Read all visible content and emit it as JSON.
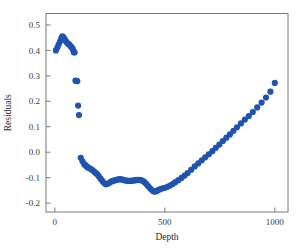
{
  "chart_data": {
    "type": "scatter",
    "title": "",
    "xlabel": "Depth",
    "ylabel": "Residuals",
    "xlim": [
      -40,
      1060
    ],
    "ylim": [
      -0.235,
      0.545
    ],
    "xticks": [
      0,
      500,
      1000
    ],
    "xtick_labels": [
      "0",
      "500",
      "1000"
    ],
    "yticks": [
      -0.2,
      -0.1,
      0.0,
      0.1,
      0.2,
      0.3,
      0.4,
      0.5
    ],
    "ytick_labels": [
      "-0.2",
      "-0.1",
      "0.0",
      "0.1",
      "0.2",
      "0.3",
      "0.4",
      "0.5"
    ],
    "grid": false,
    "legend": null,
    "marker": "circle",
    "marker_color": "#1f53b0",
    "marker_size": 3.1,
    "series": [
      {
        "name": "residuals",
        "x": [
          5,
          12,
          18,
          24,
          30,
          34,
          38,
          42,
          46,
          50,
          54,
          58,
          62,
          66,
          70,
          74,
          78,
          82,
          86,
          90,
          94,
          98,
          102,
          106,
          110,
          118,
          126,
          134,
          140,
          146,
          152,
          158,
          164,
          170,
          176,
          182,
          188,
          194,
          200,
          208,
          216,
          224,
          232,
          240,
          248,
          256,
          264,
          272,
          280,
          288,
          296,
          304,
          312,
          320,
          328,
          336,
          344,
          352,
          360,
          368,
          376,
          384,
          392,
          400,
          408,
          416,
          424,
          432,
          440,
          448,
          456,
          464,
          472,
          480,
          490,
          500,
          512,
          524,
          536,
          548,
          562,
          576,
          590,
          604,
          620,
          636,
          652,
          668,
          684,
          700,
          716,
          732,
          748,
          764,
          780,
          796,
          812,
          828,
          846,
          864,
          882,
          900,
          920,
          940,
          960,
          980,
          1000
        ],
        "y": [
          0.4,
          0.412,
          0.424,
          0.436,
          0.448,
          0.455,
          0.452,
          0.447,
          0.441,
          0.437,
          0.432,
          0.428,
          0.425,
          0.423,
          0.418,
          0.414,
          0.41,
          0.405,
          0.393,
          0.392,
          0.281,
          0.28,
          0.279,
          0.183,
          0.146,
          -0.022,
          -0.036,
          -0.047,
          -0.052,
          -0.057,
          -0.061,
          -0.063,
          -0.066,
          -0.07,
          -0.074,
          -0.079,
          -0.083,
          -0.088,
          -0.095,
          -0.104,
          -0.113,
          -0.121,
          -0.126,
          -0.124,
          -0.12,
          -0.116,
          -0.113,
          -0.111,
          -0.109,
          -0.107,
          -0.106,
          -0.107,
          -0.109,
          -0.111,
          -0.112,
          -0.113,
          -0.113,
          -0.112,
          -0.111,
          -0.11,
          -0.109,
          -0.109,
          -0.11,
          -0.113,
          -0.118,
          -0.125,
          -0.133,
          -0.141,
          -0.148,
          -0.153,
          -0.155,
          -0.152,
          -0.148,
          -0.145,
          -0.142,
          -0.14,
          -0.136,
          -0.131,
          -0.125,
          -0.118,
          -0.11,
          -0.101,
          -0.092,
          -0.082,
          -0.069,
          -0.056,
          -0.044,
          -0.032,
          -0.02,
          -0.008,
          0.004,
          0.017,
          0.03,
          0.044,
          0.057,
          0.07,
          0.084,
          0.098,
          0.113,
          0.128,
          0.142,
          0.158,
          0.176,
          0.195,
          0.215,
          0.238,
          0.272
        ]
      }
    ]
  },
  "axes": {
    "ylabel_text": "Residuals",
    "xlabel_text": "Depth"
  }
}
